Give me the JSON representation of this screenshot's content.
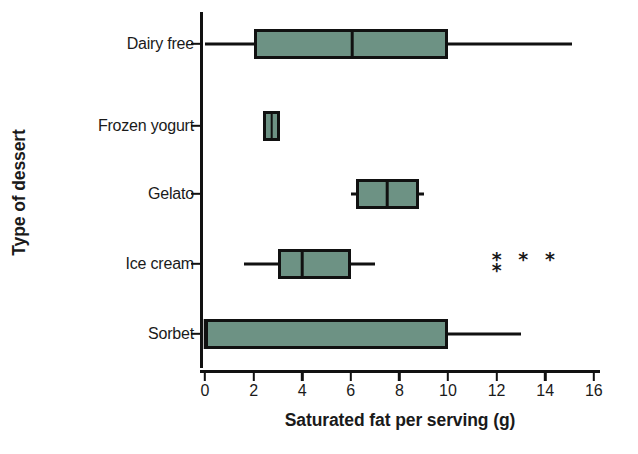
{
  "chart_data": {
    "type": "box",
    "title": "",
    "xlabel": "Saturated fat per serving (g)",
    "ylabel": "Type of dessert",
    "orientation": "horizontal",
    "xlim": [
      0,
      16.6
    ],
    "xticks": [
      0,
      2,
      4,
      6,
      8,
      10,
      12,
      14,
      16
    ],
    "xtick_labels": [
      "0",
      "2",
      "4",
      "6",
      "8",
      "10",
      "12",
      "14",
      "16"
    ],
    "grid": false,
    "legend": false,
    "box_fill_color": "#6d9284",
    "line_color": "#111111",
    "categories": [
      "Dairy free",
      "Frozen yogurt",
      "Gelato",
      "Ice cream",
      "Sorbet"
    ],
    "boxes": [
      {
        "category": "Dairy free",
        "whisker_low": 0.0,
        "q1": 2.0,
        "median": 6.05,
        "q3": 10.0,
        "whisker_high": 15.1,
        "outliers": [],
        "has_caps": false
      },
      {
        "category": "Frozen yogurt",
        "whisker_low": 2.4,
        "q1": 2.4,
        "median": 2.75,
        "q3": 3.1,
        "whisker_high": 3.1,
        "outliers": [],
        "has_caps": false
      },
      {
        "category": "Gelato",
        "whisker_low": 6.0,
        "q1": 6.2,
        "median": 7.5,
        "q3": 8.8,
        "whisker_high": 9.0,
        "outliers": [],
        "has_caps": false
      },
      {
        "category": "Ice cream",
        "whisker_low": 1.6,
        "q1": 3.0,
        "median": 4.0,
        "q3": 6.0,
        "whisker_high": 7.0,
        "outliers": [
          12.0,
          12.0,
          13.1,
          14.2
        ],
        "has_caps": false
      },
      {
        "category": "Sorbet",
        "whisker_low": 0.0,
        "q1": 0.0,
        "median": 0.0,
        "q3": 10.0,
        "whisker_high": 13.0,
        "outliers": [],
        "has_caps": false
      }
    ],
    "outlier_marker": "*"
  }
}
